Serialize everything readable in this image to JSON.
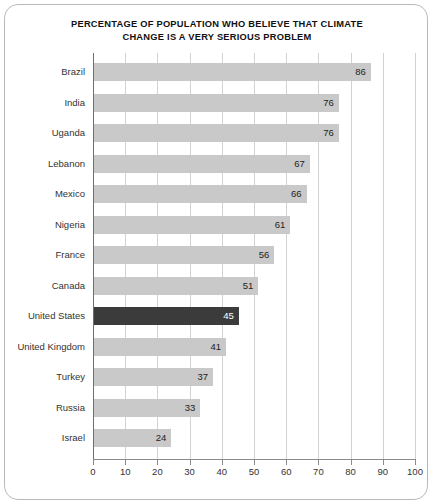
{
  "chart_data": {
    "type": "bar",
    "orientation": "horizontal",
    "title_line1": "PERCENTAGE OF POPULATION WHO BELIEVE THAT CLIMATE",
    "title_line2": "CHANGE IS A VERY SERIOUS PROBLEM",
    "xlabel": "",
    "ylabel": "",
    "xlim": [
      0,
      100
    ],
    "xticks": [
      0,
      10,
      20,
      30,
      40,
      50,
      60,
      70,
      80,
      90,
      100
    ],
    "grid": "vertical",
    "legend": "none",
    "categories": [
      "Brazil",
      "India",
      "Uganda",
      "Lebanon",
      "Mexico",
      "Nigeria",
      "France",
      "Canada",
      "United States",
      "United Kingdom",
      "Turkey",
      "Russia",
      "Israel"
    ],
    "values": [
      86,
      76,
      76,
      67,
      66,
      61,
      56,
      51,
      45,
      41,
      37,
      33,
      24
    ],
    "highlight_category": "United States",
    "colors": {
      "bar": "#c9c9c9",
      "bar_highlight": "#3b3b3b",
      "gridline": "#d2d2d2",
      "axis": "#8a8a8a",
      "text": "#333333",
      "title": "#111111",
      "card_border": "#b9b9b9",
      "background": "#ffffff"
    }
  }
}
